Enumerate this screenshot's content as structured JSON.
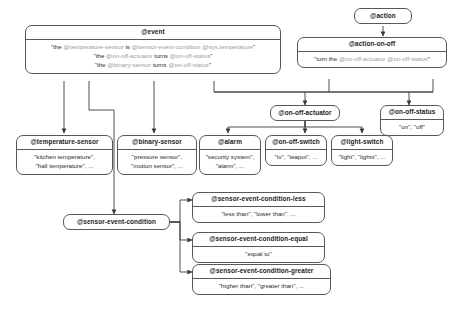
{
  "diagram": {
    "colors": {
      "border": "#585858",
      "text": "#1b1b1b",
      "token": "#9b9b9b",
      "background": "#ffffff"
    },
    "nodes": {
      "event": {
        "header": "@event",
        "lines": [
          "\"the @temperature-sensor is @sensor-event-condition @sys.temperature\"",
          "\"the @on-off-actuator turns @on-off-status\"",
          "\"the @binary-sensor turns @on-off-status\""
        ]
      },
      "action": {
        "header": "@action"
      },
      "action_on_off": {
        "header": "@action-on-off",
        "lines": [
          "\"turn the @on-off-actuator @on-off-status\""
        ]
      },
      "on_off_actuator": {
        "header": "@on-off-actuator"
      },
      "on_off_status": {
        "header": "@on-off-status",
        "lines": [
          "\"on\", \"off\""
        ]
      },
      "temperature_sensor": {
        "header": "@temperature-sensor",
        "lines": [
          "\"kitchen temperature\",",
          "\"hall temperature\", ..."
        ]
      },
      "binary_sensor": {
        "header": "@binary-sensor",
        "lines": [
          "\"pressure sensor\",",
          "\"motion sensor\", ..."
        ]
      },
      "alarm": {
        "header": "@alarm",
        "lines": [
          "\"security system\",",
          "\"alarm\", ..."
        ]
      },
      "on_off_switch": {
        "header": "@on-off-switch",
        "lines": [
          "\"tv\", \"teapot\", ..."
        ]
      },
      "light_switch": {
        "header": "@light-switch",
        "lines": [
          "\"light\", \"lights\", ..."
        ]
      },
      "sensor_event_condition": {
        "header": "@sensor-event-condition"
      },
      "sensor_event_condition_less": {
        "header": "@sensor-event-condition-less",
        "lines": [
          "\"less than\", \"lower than\", ..."
        ]
      },
      "sensor_event_condition_equal": {
        "header": "@sensor-event-condition-equal",
        "lines": [
          "\"equal to\""
        ]
      },
      "sensor_event_condition_greater": {
        "header": "@sensor-event-condition-greater",
        "lines": [
          "\"higher than\", \"greater than\", ..."
        ]
      }
    }
  }
}
